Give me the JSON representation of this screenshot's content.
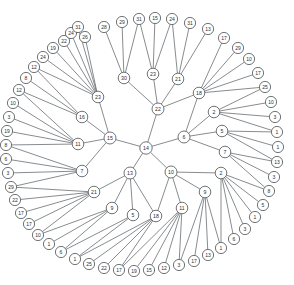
{
  "figure": {
    "type": "radial-tree",
    "background_color": "#ffffff",
    "node_fill": "#ffffff",
    "node_stroke": "#4b5054",
    "edge_color": "#555a5e",
    "width": 294,
    "height": 285,
    "center_x": 146,
    "center_y": 148
  },
  "chart_data": {
    "type": "diagram",
    "layout": "radial-tree",
    "root": "n14",
    "levels": [
      {
        "name": "root",
        "radius": 0
      },
      {
        "name": "level1",
        "radius": 34
      },
      {
        "name": "level2",
        "radius": 68
      },
      {
        "name": "level3",
        "radius": 102
      },
      {
        "name": "leaves",
        "radius": 130
      }
    ],
    "node_count": 110,
    "nodes": [
      {
        "id": "n14",
        "label": "14",
        "x": 146,
        "y": 148,
        "level": 0
      },
      {
        "id": "n22",
        "label": "22",
        "x": 158,
        "y": 109,
        "level": 1
      },
      {
        "id": "n15",
        "label": "15",
        "x": 110,
        "y": 138,
        "level": 1
      },
      {
        "id": "n6",
        "label": "6",
        "x": 184,
        "y": 137,
        "level": 1
      },
      {
        "id": "n13",
        "label": "13",
        "x": 130,
        "y": 173,
        "level": 1
      },
      {
        "id": "n10",
        "label": "10",
        "x": 171,
        "y": 172,
        "level": 1
      },
      {
        "id": "n30",
        "label": "30",
        "x": 124,
        "y": 78,
        "level": 2
      },
      {
        "id": "n23b",
        "label": "23",
        "x": 153,
        "y": 74,
        "level": 2
      },
      {
        "id": "n21b",
        "label": "21",
        "x": 178,
        "y": 79,
        "level": 2
      },
      {
        "id": "n18b",
        "label": "18",
        "x": 199,
        "y": 93,
        "level": 2
      },
      {
        "id": "n23a",
        "label": "23",
        "x": 98,
        "y": 97,
        "level": 2
      },
      {
        "id": "n16",
        "label": "16",
        "x": 82,
        "y": 117,
        "level": 2
      },
      {
        "id": "n11a",
        "label": "11",
        "x": 78,
        "y": 144,
        "level": 2
      },
      {
        "id": "n7a",
        "label": "7",
        "x": 82,
        "y": 171,
        "level": 2
      },
      {
        "id": "n2a",
        "label": "2",
        "x": 214,
        "y": 112,
        "level": 2
      },
      {
        "id": "n5a",
        "label": "5",
        "x": 222,
        "y": 131,
        "level": 2
      },
      {
        "id": "n7b",
        "label": "7",
        "x": 225,
        "y": 152,
        "level": 2
      },
      {
        "id": "n21a",
        "label": "21",
        "x": 94,
        "y": 192,
        "level": 2
      },
      {
        "id": "n9a",
        "label": "9",
        "x": 112,
        "y": 208,
        "level": 2
      },
      {
        "id": "n5b",
        "label": "5",
        "x": 133,
        "y": 215,
        "level": 2
      },
      {
        "id": "n18a",
        "label": "18",
        "x": 156,
        "y": 216,
        "level": 2
      },
      {
        "id": "n11b",
        "label": "11",
        "x": 182,
        "y": 208,
        "level": 2
      },
      {
        "id": "n9b",
        "label": "9",
        "x": 205,
        "y": 192,
        "level": 2
      },
      {
        "id": "n2b",
        "label": "2",
        "x": 221,
        "y": 173,
        "level": 2
      },
      {
        "id": "L1",
        "label": "26",
        "x": 85,
        "y": 37,
        "level": 3,
        "parent": "n23a"
      },
      {
        "id": "L2",
        "label": "28",
        "x": 104,
        "y": 27,
        "level": 3,
        "parent": "n23a"
      },
      {
        "id": "L3",
        "label": "29",
        "x": 122,
        "y": 22,
        "level": 3,
        "parent": "n30"
      },
      {
        "id": "L4",
        "label": "31",
        "x": 139,
        "y": 19,
        "level": 3,
        "parent": "n30"
      },
      {
        "id": "L5",
        "label": "15",
        "x": 155,
        "y": 18,
        "level": 3,
        "parent": "n23b"
      },
      {
        "id": "L6",
        "label": "24",
        "x": 172,
        "y": 19,
        "level": 3,
        "parent": "n23b"
      },
      {
        "id": "L7",
        "label": "31",
        "x": 190,
        "y": 23,
        "level": 3,
        "parent": "n21b"
      },
      {
        "id": "L8",
        "label": "13",
        "x": 208,
        "y": 29,
        "level": 3,
        "parent": "n21b"
      },
      {
        "id": "L9",
        "label": "17",
        "x": 224,
        "y": 38,
        "level": 3,
        "parent": "n18b"
      },
      {
        "id": "L10",
        "label": "29",
        "x": 238,
        "y": 48,
        "level": 3,
        "parent": "n18b"
      },
      {
        "id": "L11",
        "label": "10",
        "x": 249,
        "y": 59,
        "level": 3,
        "parent": "n18b"
      },
      {
        "id": "L12",
        "label": "17",
        "x": 258,
        "y": 73,
        "level": 3,
        "parent": "n18b"
      },
      {
        "id": "L13",
        "label": "25",
        "x": 265,
        "y": 87,
        "level": 3,
        "parent": "n18b"
      },
      {
        "id": "L14",
        "label": "10",
        "x": 271,
        "y": 102,
        "level": 3,
        "parent": "n2a"
      },
      {
        "id": "L15",
        "label": "3",
        "x": 275,
        "y": 117,
        "level": 3,
        "parent": "n2a"
      },
      {
        "id": "L16",
        "label": "1",
        "x": 277,
        "y": 132,
        "level": 3,
        "parent": "n2a"
      },
      {
        "id": "L17",
        "label": "1",
        "x": 278,
        "y": 147,
        "level": 3,
        "parent": "n5a"
      },
      {
        "id": "L18",
        "label": "13",
        "x": 277,
        "y": 162,
        "level": 3,
        "parent": "n5a"
      },
      {
        "id": "L19",
        "label": "3",
        "x": 274,
        "y": 177,
        "level": 3,
        "parent": "n7b"
      },
      {
        "id": "L20",
        "label": "8",
        "x": 269,
        "y": 191,
        "level": 3,
        "parent": "n7b"
      },
      {
        "id": "L21",
        "label": "5",
        "x": 263,
        "y": 205,
        "level": 3,
        "parent": "n2b"
      },
      {
        "id": "L22",
        "label": "1",
        "x": 255,
        "y": 217,
        "level": 3,
        "parent": "n2b"
      },
      {
        "id": "L23",
        "label": "3",
        "x": 245,
        "y": 229,
        "level": 3,
        "parent": "n2b"
      },
      {
        "id": "L24",
        "label": "6",
        "x": 234,
        "y": 239,
        "level": 3,
        "parent": "n2b"
      },
      {
        "id": "L25",
        "label": "1",
        "x": 221,
        "y": 248,
        "level": 3,
        "parent": "n2b"
      },
      {
        "id": "L26",
        "label": "13",
        "x": 208,
        "y": 255,
        "level": 3,
        "parent": "n9b"
      },
      {
        "id": "L27",
        "label": "17",
        "x": 194,
        "y": 261,
        "level": 3,
        "parent": "n9b"
      },
      {
        "id": "L28",
        "label": "3",
        "x": 179,
        "y": 265,
        "level": 3,
        "parent": "n9b"
      },
      {
        "id": "L29",
        "label": "12",
        "x": 164,
        "y": 268,
        "level": 3,
        "parent": "n11b"
      },
      {
        "id": "L30",
        "label": "15",
        "x": 149,
        "y": 270,
        "level": 3,
        "parent": "n11b"
      },
      {
        "id": "L31",
        "label": "19",
        "x": 134,
        "y": 271,
        "level": 3,
        "parent": "n11b"
      },
      {
        "id": "L32",
        "label": "17",
        "x": 119,
        "y": 270,
        "level": 3,
        "parent": "n11b"
      },
      {
        "id": "L33",
        "label": "22",
        "x": 104,
        "y": 268,
        "level": 3,
        "parent": "n18a"
      },
      {
        "id": "L34",
        "label": "25",
        "x": 89,
        "y": 264,
        "level": 3,
        "parent": "n18a"
      },
      {
        "id": "L35",
        "label": "1",
        "x": 75,
        "y": 259,
        "level": 3,
        "parent": "n18a"
      },
      {
        "id": "L36",
        "label": "6",
        "x": 61,
        "y": 252,
        "level": 3,
        "parent": "n5b"
      },
      {
        "id": "L37",
        "label": "1",
        "x": 49,
        "y": 244,
        "level": 3,
        "parent": "n9a"
      },
      {
        "id": "L38",
        "label": "10",
        "x": 38,
        "y": 235,
        "level": 3,
        "parent": "n9a"
      },
      {
        "id": "L39",
        "label": "17",
        "x": 29,
        "y": 224,
        "level": 3,
        "parent": "n21a"
      },
      {
        "id": "L40",
        "label": "17",
        "x": 21,
        "y": 213,
        "level": 3,
        "parent": "n21a"
      },
      {
        "id": "L41",
        "label": "22",
        "x": 15,
        "y": 200,
        "level": 3,
        "parent": "n21a"
      },
      {
        "id": "L42",
        "label": "29",
        "x": 11,
        "y": 187,
        "level": 3,
        "parent": "n21a"
      },
      {
        "id": "L43",
        "label": "3",
        "x": 8,
        "y": 173,
        "level": 3,
        "parent": "n7a"
      },
      {
        "id": "L44",
        "label": "6",
        "x": 6,
        "y": 159,
        "level": 3,
        "parent": "n7a"
      },
      {
        "id": "L45",
        "label": "8",
        "x": 6,
        "y": 145,
        "level": 3,
        "parent": "n7a"
      },
      {
        "id": "L46",
        "label": "19",
        "x": 7,
        "y": 131,
        "level": 3,
        "parent": "n11a"
      },
      {
        "id": "L47",
        "label": "3",
        "x": 9,
        "y": 117,
        "level": 3,
        "parent": "n11a"
      },
      {
        "id": "L48",
        "label": "10",
        "x": 13,
        "y": 103,
        "level": 3,
        "parent": "n11a"
      },
      {
        "id": "L49",
        "label": "12",
        "x": 19,
        "y": 90,
        "level": 3,
        "parent": "n11a"
      },
      {
        "id": "L50",
        "label": "8",
        "x": 26,
        "y": 78,
        "level": 3,
        "parent": "n16"
      },
      {
        "id": "L51",
        "label": "12",
        "x": 34,
        "y": 67,
        "level": 3,
        "parent": "n16"
      },
      {
        "id": "L52",
        "label": "24",
        "x": 43,
        "y": 57,
        "level": 3,
        "parent": "n23a"
      },
      {
        "id": "L53",
        "label": "19",
        "x": 53,
        "y": 48,
        "level": 3,
        "parent": "n23a"
      },
      {
        "id": "L54",
        "label": "22",
        "x": 64,
        "y": 41,
        "level": 3,
        "parent": "n23a"
      },
      {
        "id": "L55",
        "label": "24",
        "x": 71,
        "y": 33,
        "level": 3,
        "parent": "n23a"
      },
      {
        "id": "L56",
        "label": "31",
        "x": 78,
        "y": 27,
        "level": 3,
        "parent": "n23a"
      }
    ],
    "edges": [
      [
        "n14",
        "n22"
      ],
      [
        "n14",
        "n15"
      ],
      [
        "n14",
        "n6"
      ],
      [
        "n14",
        "n13"
      ],
      [
        "n14",
        "n10"
      ],
      [
        "n22",
        "n30"
      ],
      [
        "n22",
        "n23b"
      ],
      [
        "n22",
        "n21b"
      ],
      [
        "n22",
        "n18b"
      ],
      [
        "n15",
        "n23a"
      ],
      [
        "n15",
        "n16"
      ],
      [
        "n15",
        "n11a"
      ],
      [
        "n15",
        "n7a"
      ],
      [
        "n6",
        "n2a"
      ],
      [
        "n6",
        "n5a"
      ],
      [
        "n6",
        "n7b"
      ],
      [
        "n6",
        "n18b"
      ],
      [
        "n13",
        "n21a"
      ],
      [
        "n13",
        "n9a"
      ],
      [
        "n13",
        "n5b"
      ],
      [
        "n13",
        "n18a"
      ],
      [
        "n10",
        "n18a"
      ],
      [
        "n10",
        "n11b"
      ],
      [
        "n10",
        "n9b"
      ],
      [
        "n10",
        "n2b"
      ],
      [
        "n30",
        "L3"
      ],
      [
        "n30",
        "L4"
      ],
      [
        "n30",
        "L2"
      ],
      [
        "n23b",
        "L5"
      ],
      [
        "n23b",
        "L6"
      ],
      [
        "n23b",
        "L4"
      ],
      [
        "n21b",
        "L7"
      ],
      [
        "n21b",
        "L8"
      ],
      [
        "n21b",
        "L6"
      ],
      [
        "n18b",
        "L9"
      ],
      [
        "n18b",
        "L10"
      ],
      [
        "n18b",
        "L11"
      ],
      [
        "n18b",
        "L12"
      ],
      [
        "n18b",
        "L13"
      ],
      [
        "n2a",
        "L14"
      ],
      [
        "n2a",
        "L15"
      ],
      [
        "n2a",
        "L16"
      ],
      [
        "n2a",
        "L13"
      ],
      [
        "n5a",
        "L17"
      ],
      [
        "n5a",
        "L18"
      ],
      [
        "n5a",
        "L16"
      ],
      [
        "n7b",
        "L19"
      ],
      [
        "n7b",
        "L20"
      ],
      [
        "n7b",
        "L18"
      ],
      [
        "n2b",
        "L21"
      ],
      [
        "n2b",
        "L22"
      ],
      [
        "n2b",
        "L23"
      ],
      [
        "n2b",
        "L24"
      ],
      [
        "n2b",
        "L25"
      ],
      [
        "n2b",
        "L20"
      ],
      [
        "n9b",
        "L26"
      ],
      [
        "n9b",
        "L27"
      ],
      [
        "n9b",
        "L28"
      ],
      [
        "n9b",
        "L25"
      ],
      [
        "n11b",
        "L29"
      ],
      [
        "n11b",
        "L30"
      ],
      [
        "n11b",
        "L31"
      ],
      [
        "n11b",
        "L32"
      ],
      [
        "n11b",
        "L28"
      ],
      [
        "n18a",
        "L33"
      ],
      [
        "n18a",
        "L34"
      ],
      [
        "n18a",
        "L35"
      ],
      [
        "n18a",
        "L32"
      ],
      [
        "n5b",
        "L36"
      ],
      [
        "n5b",
        "L35"
      ],
      [
        "n9a",
        "L37"
      ],
      [
        "n9a",
        "L38"
      ],
      [
        "n9a",
        "L36"
      ],
      [
        "n21a",
        "L39"
      ],
      [
        "n21a",
        "L40"
      ],
      [
        "n21a",
        "L41"
      ],
      [
        "n21a",
        "L42"
      ],
      [
        "n21a",
        "L38"
      ],
      [
        "n7a",
        "L43"
      ],
      [
        "n7a",
        "L44"
      ],
      [
        "n7a",
        "L45"
      ],
      [
        "n7a",
        "L42"
      ],
      [
        "n11a",
        "L46"
      ],
      [
        "n11a",
        "L47"
      ],
      [
        "n11a",
        "L48"
      ],
      [
        "n11a",
        "L49"
      ],
      [
        "n11a",
        "L45"
      ],
      [
        "n16",
        "L50"
      ],
      [
        "n16",
        "L51"
      ],
      [
        "n16",
        "L49"
      ],
      [
        "n23a",
        "L52"
      ],
      [
        "n23a",
        "L53"
      ],
      [
        "n23a",
        "L54"
      ],
      [
        "n23a",
        "L55"
      ],
      [
        "n23a",
        "L56"
      ],
      [
        "n23a",
        "L1"
      ],
      [
        "n23a",
        "L51"
      ]
    ],
    "title": "",
    "xlabel": "",
    "ylabel": "",
    "legend": []
  }
}
